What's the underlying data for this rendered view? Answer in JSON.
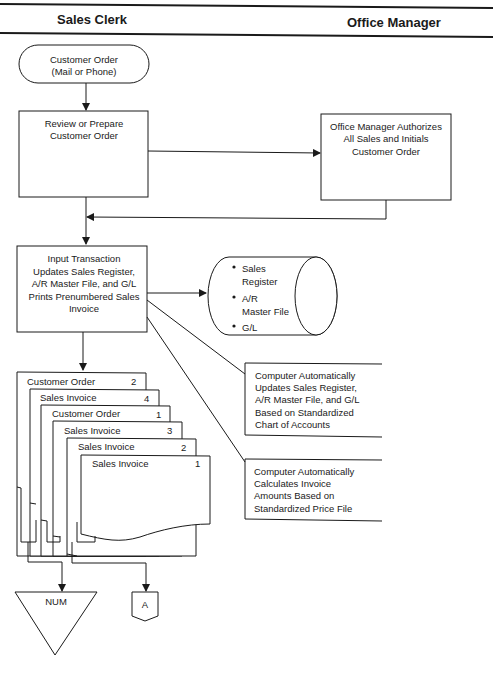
{
  "lanes": {
    "left": "Sales Clerk",
    "right": "Office Manager"
  },
  "start": {
    "line1": "Customer Order",
    "line2": "(Mail or Phone)"
  },
  "review": {
    "line1": "Review or Prepare",
    "line2": "Customer Order"
  },
  "authorize": {
    "line1": "Office Manager Authorizes",
    "line2": "All Sales and Initials",
    "line3": "Customer Order"
  },
  "input": {
    "line1": "Input Transaction",
    "line2": "Updates Sales Register,",
    "line3": "A/R Master File, and G/L",
    "line4": "Prints Prenumbered Sales",
    "line5": "Invoice"
  },
  "storage": {
    "items": [
      "Sales",
      "Register",
      "A/R",
      "Master File",
      "G/L"
    ]
  },
  "annotation1": {
    "line1": "Computer Automatically",
    "line2": "Updates Sales Register,",
    "line3": "A/R Master File, and G/L",
    "line4": "Based on Standardized",
    "line5": "Chart of Accounts"
  },
  "annotation2": {
    "line1": "Computer Automatically",
    "line2": "Calculates Invoice",
    "line3": "Amounts Based on",
    "line4": "Standardized Price File"
  },
  "documents": [
    {
      "name": "Customer Order",
      "copy": "2"
    },
    {
      "name": "Sales Invoice",
      "copy": "4"
    },
    {
      "name": "Customer Order",
      "copy": "1"
    },
    {
      "name": "Sales Invoice",
      "copy": "3"
    },
    {
      "name": "Sales Invoice",
      "copy": "2"
    },
    {
      "name": "Sales Invoice",
      "copy": "1"
    }
  ],
  "file_symbol": "NUM",
  "connector": "A"
}
